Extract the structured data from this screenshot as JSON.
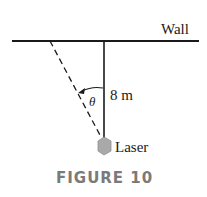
{
  "figure": {
    "wall_label": "Wall",
    "distance_label": "8 m",
    "angle_label": "θ",
    "source_label": "Laser",
    "caption": "FIGURE 10"
  },
  "colors": {
    "line": "#1a1a1a",
    "laser_fill": "#a9a9a9",
    "caption": "#7a7a7a"
  }
}
